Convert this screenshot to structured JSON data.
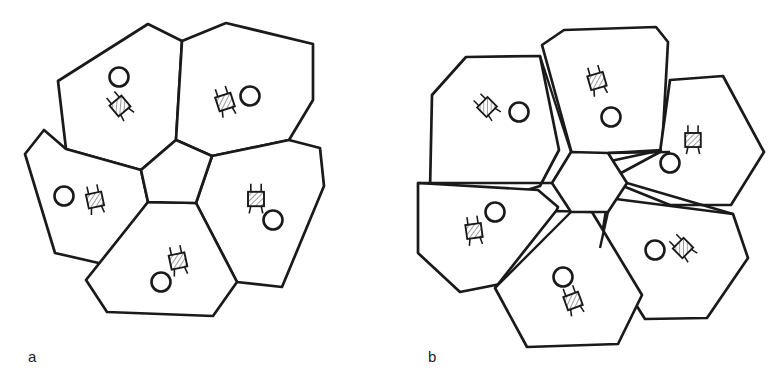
{
  "figure": {
    "kind": "line-drawing",
    "background_color": "#FFFFFF",
    "stroke_color": "#1A1A1A",
    "hatch_color": "#1A1A1A",
    "panels": [
      {
        "id": "a",
        "label": "a",
        "core_shape": "pentagon",
        "core_sides": 5,
        "petal_count": 5,
        "petals_touch_core": true,
        "gaps_between_petals": false,
        "rooms": [
          {
            "name": "room-a-top-left",
            "person": "circle",
            "furniture": "hatched-chair",
            "furniture_rotation_deg": -40,
            "person_position": "above-left-of-furniture"
          },
          {
            "name": "room-a-top-right",
            "person": "circle",
            "furniture": "hatched-chair",
            "furniture_rotation_deg": -18,
            "person_position": "right-of-furniture"
          },
          {
            "name": "room-a-left",
            "person": "circle",
            "furniture": "hatched-chair",
            "furniture_rotation_deg": -12,
            "person_position": "left-of-furniture"
          },
          {
            "name": "room-a-right",
            "person": "circle",
            "furniture": "hatched-chair",
            "furniture_rotation_deg": 0,
            "person_position": "below-right-of-furniture"
          },
          {
            "name": "room-a-bottom",
            "person": "circle",
            "furniture": "hatched-chair",
            "furniture_rotation_deg": -12,
            "person_position": "below-left-of-furniture"
          }
        ]
      },
      {
        "id": "b",
        "label": "b",
        "core_shape": "hexagon",
        "core_sides": 6,
        "petal_count": 5,
        "petals_touch_core": true,
        "gaps_between_petals": true,
        "rooms": [
          {
            "name": "room-b-top",
            "person": "circle",
            "furniture": "hatched-chair",
            "furniture_rotation_deg": -16,
            "person_position": "below-right-of-furniture"
          },
          {
            "name": "room-b-upper-left",
            "person": "circle",
            "furniture": "hatched-chair",
            "furniture_rotation_deg": -45,
            "person_position": "right-of-furniture"
          },
          {
            "name": "room-b-upper-right",
            "person": "circle",
            "furniture": "hatched-chair",
            "furniture_rotation_deg": 0,
            "person_position": "below-left-of-furniture"
          },
          {
            "name": "room-b-lower-left",
            "person": "circle",
            "furniture": "hatched-chair",
            "furniture_rotation_deg": -8,
            "person_position": "above-right-of-furniture"
          },
          {
            "name": "room-b-lower-right",
            "person": "circle",
            "furniture": "hatched-chair",
            "furniture_rotation_deg": -45,
            "person_position": "left-of-furniture"
          },
          {
            "name": "room-b-bottom",
            "person": "circle",
            "furniture": "hatched-chair",
            "furniture_rotation_deg": -20,
            "person_position": "above-left-of-furniture"
          }
        ]
      }
    ],
    "symbols": {
      "person": {
        "name": "person-circle-icon",
        "shape": "circle-outline"
      },
      "furniture": {
        "name": "hatched-chair-icon",
        "shape": "hatched-square-with-legs"
      }
    }
  }
}
